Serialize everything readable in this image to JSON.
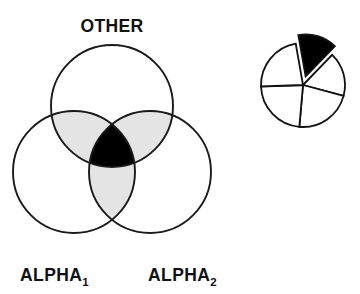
{
  "figure": {
    "background_color": "#ffffff",
    "ink_color": "#111111",
    "shade_color": "#e4e4e4",
    "fill_color": "#000000"
  },
  "venn": {
    "name": "three-set-venn-diagram",
    "labels": {
      "top": "OTHER",
      "bottom_left_base": "ALPHA",
      "bottom_left_sub": "1",
      "bottom_right_base": "ALPHA",
      "bottom_right_sub": "2"
    },
    "circles": [
      {
        "id": "other",
        "label": "OTHER",
        "cx": 112,
        "cy": 106,
        "r": 61
      },
      {
        "id": "alpha1",
        "label": "ALPHA1",
        "cx": 74,
        "cy": 172,
        "r": 61
      },
      {
        "id": "alpha2",
        "label": "ALPHA2",
        "cx": 150,
        "cy": 172,
        "r": 61
      }
    ],
    "regions": [
      {
        "id": "other-alpha1",
        "shading": "light-gray",
        "color": "#e4e4e4"
      },
      {
        "id": "other-alpha2",
        "shading": "light-gray",
        "color": "#e4e4e4"
      },
      {
        "id": "alpha1-alpha2",
        "shading": "light-gray",
        "color": "#e4e4e4"
      },
      {
        "id": "all-three",
        "shading": "solid-black",
        "color": "#000000"
      }
    ]
  },
  "chart_data": {
    "type": "pie",
    "title": "",
    "xlabel": "",
    "ylabel": "",
    "center": {
      "cx": 303,
      "cy": 85
    },
    "radius": 42,
    "legend": "none",
    "grid": false,
    "categories": [
      "slice-1",
      "slice-2",
      "slice-3",
      "slice-4",
      "slice-5"
    ],
    "values": [
      15,
      17,
      22,
      23,
      23
    ],
    "start_angle_deg": -100,
    "slices": [
      {
        "name": "slice-1",
        "start_deg": -100,
        "end_deg": -46,
        "value": 15,
        "fill": "#000000",
        "exploded": true,
        "explode_offset": 9
      },
      {
        "name": "slice-2",
        "start_deg": -46,
        "end_deg": 15,
        "value": 17,
        "fill": "#ffffff",
        "exploded": false,
        "explode_offset": 0
      },
      {
        "name": "slice-3",
        "start_deg": 15,
        "end_deg": 95,
        "value": 22,
        "fill": "#ffffff",
        "exploded": false,
        "explode_offset": 0
      },
      {
        "name": "slice-4",
        "start_deg": 95,
        "end_deg": 178,
        "value": 23,
        "fill": "#ffffff",
        "exploded": false,
        "explode_offset": 0
      },
      {
        "name": "slice-5",
        "start_deg": 178,
        "end_deg": 260,
        "value": 23,
        "fill": "#ffffff",
        "exploded": false,
        "explode_offset": 0
      }
    ]
  }
}
